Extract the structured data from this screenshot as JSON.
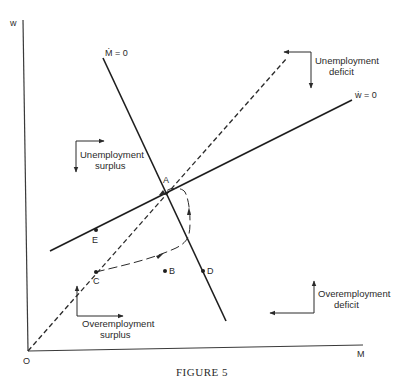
{
  "figure": {
    "caption": "FIGURE 5",
    "axes": {
      "y_label": "w",
      "x_label": "M",
      "origin_label": "O"
    },
    "curves": {
      "m_dot_zero": {
        "label": "Ṁ = 0",
        "style": "solid"
      },
      "w_dot_zero": {
        "label": "ẇ = 0",
        "style": "solid"
      },
      "ray": {
        "label": "",
        "style": "dashed"
      },
      "trajectory": {
        "label": "",
        "style": "long-dashed"
      }
    },
    "points": [
      {
        "id": "A",
        "label": "A"
      },
      {
        "id": "B",
        "label": "B"
      },
      {
        "id": "C",
        "label": "C"
      },
      {
        "id": "D",
        "label": "D"
      },
      {
        "id": "E",
        "label": "E"
      }
    ],
    "regions": {
      "unemployment_deficit": {
        "line1": "Unemployment",
        "line2": "deficit"
      },
      "unemployment_surplus": {
        "line1": "Unemployment",
        "line2": "surplus"
      },
      "overemployment_deficit": {
        "line1": "Overemployment",
        "line2": "deficit"
      },
      "overemployment_surplus": {
        "line1": "Overemployment",
        "line2": "surplus"
      }
    }
  }
}
